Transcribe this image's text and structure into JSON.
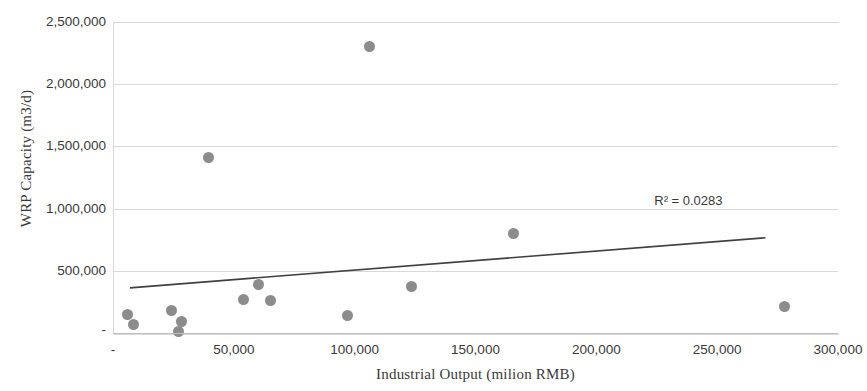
{
  "chart_data": {
    "type": "scatter",
    "title": "",
    "xlabel": "Industrial Output (milion RMB)",
    "ylabel": "WRP Capacity (m3/d)",
    "xlim": [
      0,
      300000
    ],
    "ylim": [
      0,
      2500000
    ],
    "grid": true,
    "legend": false,
    "x_tick_labels": [
      "-",
      "50,000",
      "100,000",
      "150,000",
      "200,000",
      "250,000",
      "300,000"
    ],
    "x_tick_values": [
      0,
      50000,
      100000,
      150000,
      200000,
      250000,
      300000
    ],
    "y_tick_labels": [
      "-",
      "500,000",
      "1,000,000",
      "1,500,000",
      "2,000,000",
      "2,500,000"
    ],
    "y_tick_values": [
      0,
      500000,
      1000000,
      1500000,
      2000000,
      2500000
    ],
    "marker_color": "#8c8c8c",
    "trendline_color": "#404040",
    "annotations": [
      {
        "text": "R² = 0.0283",
        "x": 243000,
        "y": 1060000
      }
    ],
    "trendline": {
      "x_start": 7000,
      "y_start": 363000,
      "x_end": 270000,
      "y_end": 766000
    },
    "points": [
      {
        "x": 6200,
        "y": 145000
      },
      {
        "x": 8300,
        "y": 65000
      },
      {
        "x": 24000,
        "y": 177000
      },
      {
        "x": 28500,
        "y": 89000
      },
      {
        "x": 27000,
        "y": 16000
      },
      {
        "x": 39700,
        "y": 1411000
      },
      {
        "x": 53800,
        "y": 266000
      },
      {
        "x": 60400,
        "y": 387000
      },
      {
        "x": 65000,
        "y": 258000
      },
      {
        "x": 97000,
        "y": 137000
      },
      {
        "x": 106300,
        "y": 2306000
      },
      {
        "x": 123700,
        "y": 371000
      },
      {
        "x": 165900,
        "y": 798000
      },
      {
        "x": 277700,
        "y": 210000
      }
    ]
  }
}
